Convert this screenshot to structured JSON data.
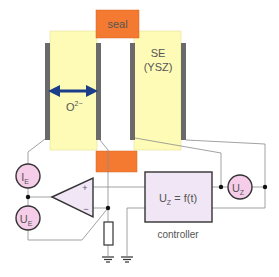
{
  "labels": {
    "seal": "seal",
    "se_line1": "SE",
    "se_line2": "(YSZ)",
    "oxygen_ion": "O",
    "oxygen_charge": "2−",
    "ie_main": "I",
    "ie_sub": "E",
    "ue_main": "U",
    "ue_sub": "E",
    "uz_main": "U",
    "uz_sub": "Z",
    "opamp_plus": "+",
    "opamp_minus": "−",
    "controller_formula_main": "U",
    "controller_formula_sub": "Z",
    "controller_formula_rest": " = f(t)",
    "controller_caption": "controller"
  },
  "colors": {
    "electrolyte": "#fdfbb6",
    "seal": "#f37a30",
    "electrode": "#6a6a6a",
    "arrow": "#1c3d8a",
    "source_fill": "#f6cde8",
    "controller_fill": "#f1e6f6",
    "opamp_fill": "#f1e6f6",
    "wire": "#8a8a8a"
  }
}
